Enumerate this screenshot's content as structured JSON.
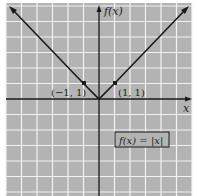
{
  "chart_data": {
    "type": "line",
    "title": "",
    "function_label": "f(x) = |x|",
    "xlabel": "x",
    "ylabel": "f(x)",
    "xlim": [
      -6,
      6
    ],
    "ylim": [
      -6,
      6
    ],
    "grid": true,
    "series": [
      {
        "name": "f(x) = |x|",
        "x": [
          -6,
          -1,
          0,
          1,
          6
        ],
        "y": [
          6,
          1,
          0,
          1,
          6
        ]
      }
    ],
    "points": [
      {
        "x": -1,
        "y": 1,
        "label": "(−1, 1)"
      },
      {
        "x": 1,
        "y": 1,
        "label": "(1, 1)"
      }
    ]
  },
  "colors": {
    "background": "#b3b3b3",
    "grid": "#f2f2f2",
    "line": "#1a1a1a",
    "axis": "#1a1a1a"
  },
  "labels": {
    "x_axis": "x",
    "y_axis": "f(x)",
    "point_left": "(−1, 1)",
    "point_right": "(1, 1)",
    "equation": "f(x) = |x|"
  }
}
